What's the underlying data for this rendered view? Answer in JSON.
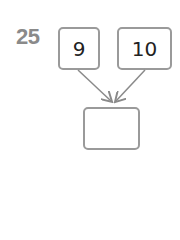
{
  "problem": {
    "number": "25",
    "inputs": [
      "9",
      "10"
    ],
    "answer": ""
  },
  "colors": {
    "number": "#8a8a8a",
    "border": "#9a9a9a",
    "arrow": "#8a8a8a"
  }
}
